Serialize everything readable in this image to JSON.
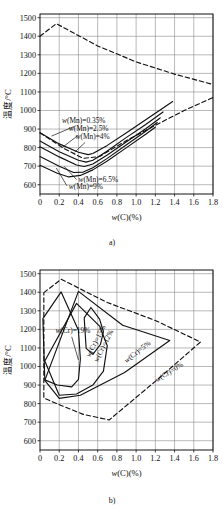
{
  "figure": {
    "panels": [
      {
        "id": "a",
        "caption": "a)",
        "chart_data": {
          "type": "line",
          "title": "",
          "xlabel": "w(C)(%)",
          "ylabel": "温度/°C",
          "xlim": [
            0,
            1.8
          ],
          "ylim": [
            550,
            1520
          ],
          "xticks": [
            "0",
            "0.2",
            "0.4",
            "0.6",
            "0.8",
            "1.0",
            "1.2",
            "1.4",
            "1.6",
            "1.8"
          ],
          "xtickvals": [
            0,
            0.2,
            0.4,
            0.6,
            0.8,
            1.0,
            1.2,
            1.4,
            1.6,
            1.8
          ],
          "yticks": [
            "600",
            "700",
            "800",
            "900",
            "1000",
            "1100",
            "1200",
            "1300",
            "1400",
            "1500"
          ],
          "ytickvals": [
            600,
            700,
            800,
            900,
            1000,
            1100,
            1200,
            1300,
            1400,
            1500
          ],
          "grid": true,
          "legend_position": "inline-annotations",
          "series": [
            {
              "name": "w(Mn)=0.35%",
              "style": "solid",
              "label_x": 0.23,
              "label_y": 935,
              "leader": [
                [
                  0.36,
                  915
                ],
                [
                  0.12,
                  862
                ]
              ],
              "points": [
                [
                  0.0,
                  880
                ],
                [
                  0.2,
                  820
                ],
                [
                  0.4,
                  775
                ],
                [
                  0.5,
                  762
                ],
                [
                  0.55,
                  768
                ],
                [
                  0.7,
                  812
                ],
                [
                  0.9,
                  880
                ],
                [
                  1.1,
                  950
                ],
                [
                  1.3,
                  1020
                ],
                [
                  1.38,
                  1048
                ]
              ]
            },
            {
              "name": "w(Mn)=2.5%",
              "style": "solid",
              "label_x": 0.3,
              "label_y": 888,
              "leader": [
                [
                  0.4,
                  868
                ],
                [
                  0.23,
                  800
                ]
              ],
              "points": [
                [
                  0.0,
                  835
                ],
                [
                  0.2,
                  778
                ],
                [
                  0.4,
                  732
                ],
                [
                  0.48,
                  722
                ],
                [
                  0.55,
                  732
                ],
                [
                  0.7,
                  782
                ],
                [
                  0.9,
                  855
                ],
                [
                  1.1,
                  925
                ],
                [
                  1.28,
                  992
                ]
              ]
            },
            {
              "name": "w(Mn)=4%",
              "style": "solid",
              "label_x": 0.37,
              "label_y": 845,
              "leader": [
                [
                  0.47,
                  828
                ],
                [
                  0.36,
                  775
                ]
              ],
              "points": [
                [
                  0.0,
                  805
                ],
                [
                  0.2,
                  750
                ],
                [
                  0.38,
                  706
                ],
                [
                  0.46,
                  698
                ],
                [
                  0.55,
                  712
                ],
                [
                  0.7,
                  760
                ],
                [
                  0.9,
                  832
                ],
                [
                  1.1,
                  902
                ],
                [
                  1.25,
                  960
                ]
              ]
            },
            {
              "name": "w(Mn)=6.5%",
              "style": "solid",
              "label_x": 0.4,
              "label_y": 612,
              "leader": [
                [
                  0.38,
                  628
                ],
                [
                  0.25,
                  700
                ]
              ],
              "points": [
                [
                  0.0,
                  752
                ],
                [
                  0.2,
                  700
                ],
                [
                  0.35,
                  666
                ],
                [
                  0.45,
                  668
                ],
                [
                  0.55,
                  692
                ],
                [
                  0.7,
                  742
                ],
                [
                  0.9,
                  815
                ],
                [
                  1.1,
                  888
                ],
                [
                  1.22,
                  935
                ]
              ]
            },
            {
              "name": "w(Mn)=9%",
              "style": "solid",
              "label_x": 0.3,
              "label_y": 578,
              "leader": [
                [
                  0.28,
                  594
                ],
                [
                  0.17,
                  690
                ]
              ],
              "points": [
                [
                  0.0,
                  705
                ],
                [
                  0.18,
                  662
                ],
                [
                  0.3,
                  642
                ],
                [
                  0.42,
                  650
                ],
                [
                  0.55,
                  680
                ],
                [
                  0.7,
                  728
                ],
                [
                  0.9,
                  800
                ],
                [
                  1.1,
                  872
                ],
                [
                  1.2,
                  910
                ]
              ]
            },
            {
              "name": "liquidus-boundary-upper",
              "style": "dashed",
              "points": [
                [
                  0.0,
                  1400
                ],
                [
                  0.17,
                  1468
                ],
                [
                  0.6,
                  1348
                ],
                [
                  1.0,
                  1262
                ],
                [
                  1.4,
                  1196
                ],
                [
                  1.8,
                  1140
                ]
              ]
            },
            {
              "name": "solidus-boundary-lower",
              "style": "dashed",
              "points": [
                [
                  0.0,
                  880
                ],
                [
                  0.25,
                  795
                ],
                [
                  0.45,
                  742
                ],
                [
                  0.62,
                  752
                ],
                [
                  0.9,
                  838
                ],
                [
                  1.2,
                  920
                ],
                [
                  1.5,
                  1000
                ],
                [
                  1.8,
                  1070
                ]
              ]
            }
          ]
        }
      },
      {
        "id": "b",
        "caption": "b)",
        "chart_data": {
          "type": "line",
          "title": "",
          "xlabel": "w(C)(%)",
          "ylabel": "温度/°C",
          "xlim": [
            0,
            1.8
          ],
          "ylim": [
            550,
            1520
          ],
          "xticks": [
            "0",
            "0.2",
            "0.4",
            "0.6",
            "0.8",
            "1.0",
            "1.2",
            "1.4",
            "1.6",
            "1.8"
          ],
          "xtickvals": [
            0,
            0.2,
            0.4,
            0.6,
            0.8,
            1.0,
            1.2,
            1.4,
            1.6,
            1.8
          ],
          "yticks": [
            "600",
            "700",
            "800",
            "900",
            "1000",
            "1100",
            "1200",
            "1300",
            "1400",
            "1500"
          ],
          "ytickvals": [
            600,
            700,
            800,
            900,
            1000,
            1100,
            1200,
            1300,
            1400,
            1500
          ],
          "grid": true,
          "legend_position": "inline-annotations",
          "series": [
            {
              "name": "w(Cr)=19%",
              "style": "solid",
              "label_x": 0.16,
              "label_y": 1178,
              "label_rotate": 0,
              "leader": [
                [
                  0.33,
                  1160
                ],
                [
                  0.4,
                  1035
                ]
              ],
              "points": [
                [
                  0.03,
                  1258
                ],
                [
                  0.22,
                  1402
                ],
                [
                  0.4,
                  1195
                ],
                [
                  0.42,
                  1040
                ],
                [
                  0.4,
                  930
                ],
                [
                  0.33,
                  890
                ],
                [
                  0.18,
                  900
                ],
                [
                  0.05,
                  928
                ],
                [
                  0.03,
                  1258
                ]
              ]
            },
            {
              "name": "w(Cr)=15%",
              "style": "solid",
              "label_x": 0.52,
              "label_y": 1048,
              "label_rotate": -63,
              "points": [
                [
                  0.05,
                  1030
                ],
                [
                  0.38,
                  1340
                ],
                [
                  0.62,
                  1218
                ],
                [
                  0.7,
                  1112
                ],
                [
                  0.66,
                  975
                ],
                [
                  0.55,
                  900
                ],
                [
                  0.38,
                  852
                ],
                [
                  0.2,
                  845
                ],
                [
                  0.05,
                  1030
                ]
              ]
            },
            {
              "name": "w(Cr)=12%",
              "style": "solid",
              "label_x": 0.6,
              "label_y": 1022,
              "label_rotate": -63,
              "points": [
                [
                  0.46,
                  1262
                ],
                [
                  0.53,
                  1318
                ],
                [
                  0.62,
                  1255
                ],
                [
                  0.66,
                  1188
                ],
                [
                  0.63,
                  1120
                ],
                [
                  0.55,
                  1065
                ],
                [
                  0.48,
                  1098
                ],
                [
                  0.46,
                  1262
                ]
              ]
            },
            {
              "name": "w(Cr)=5%",
              "style": "solid",
              "label_x": 0.9,
              "label_y": 1018,
              "label_rotate": -38,
              "points": [
                [
                  0.05,
                  925
                ],
                [
                  0.4,
                  1405
                ],
                [
                  0.86,
                  1222
                ],
                [
                  1.35,
                  1140
                ],
                [
                  0.88,
                  968
                ],
                [
                  0.42,
                  845
                ],
                [
                  0.2,
                  828
                ],
                [
                  0.05,
                  925
                ]
              ]
            },
            {
              "name": "w(Cr)=0%",
              "style": "dashed",
              "label_x": 1.22,
              "label_y": 915,
              "label_rotate": -32,
              "points": [
                [
                  0.04,
                  1398
                ],
                [
                  0.22,
                  1470
                ],
                [
                  0.7,
                  1345
                ],
                [
                  1.2,
                  1248
                ],
                [
                  1.67,
                  1132
                ],
                [
                  1.2,
                  920
                ],
                [
                  0.72,
                  712
                ],
                [
                  0.45,
                  742
                ],
                [
                  0.22,
                  790
                ],
                [
                  0.04,
                  830
                ],
                [
                  0.04,
                  1398
                ]
              ]
            }
          ]
        }
      }
    ]
  }
}
